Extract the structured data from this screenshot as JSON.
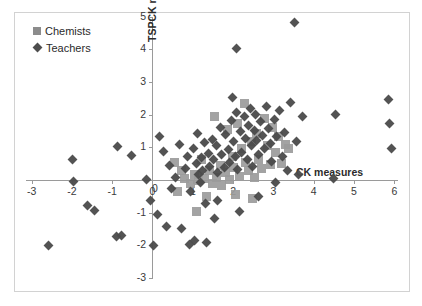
{
  "chart_data": {
    "type": "scatter",
    "title": "",
    "xlabel": "CK measures",
    "ylabel": "TSPCK measures",
    "xlim": [
      -3.2,
      6.2
    ],
    "ylim": [
      -3,
      5
    ],
    "xticks": [
      -3,
      -2,
      -1,
      0,
      1,
      2,
      3,
      4,
      5,
      6
    ],
    "xticklabels": [
      "-3",
      "-2",
      "-1",
      "0",
      "1",
      "2",
      "3",
      "4",
      "5",
      "6"
    ],
    "yticks": [
      -3,
      -2,
      -1,
      0,
      1,
      2,
      3,
      4,
      5
    ],
    "yticklabels": [
      "-3",
      "-2",
      "-1",
      "0",
      "1",
      "2",
      "3",
      "4",
      "5"
    ],
    "grid": false,
    "legend_position": "top-left",
    "legend": [
      "Chemists",
      "Teachers"
    ],
    "colors": {
      "chemists": "#9b9b9b",
      "teachers": "#4a4a4a",
      "axis": "#9a9a9a",
      "frame": "#d2d2d2",
      "text": "#2b2b2b"
    },
    "series": [
      {
        "name": "Chemists",
        "marker": "square",
        "color": "#9b9b9b",
        "points": [
          [
            0.55,
            0.55
          ],
          [
            0.72,
            0.28
          ],
          [
            0.8,
            0.05
          ],
          [
            0.95,
            -0.1
          ],
          [
            1.05,
            0.18
          ],
          [
            1.15,
            -0.02
          ],
          [
            1.22,
            0.62
          ],
          [
            1.28,
            0.05
          ],
          [
            1.35,
            -0.52
          ],
          [
            1.42,
            0.3
          ],
          [
            1.48,
            -0.12
          ],
          [
            1.55,
            1.95
          ],
          [
            1.6,
            0.08
          ],
          [
            1.68,
            0.45
          ],
          [
            1.72,
            -0.18
          ],
          [
            1.8,
            0.22
          ],
          [
            1.85,
            1.55
          ],
          [
            1.92,
            0.02
          ],
          [
            1.98,
            0.72
          ],
          [
            2.02,
            0.38
          ],
          [
            2.1,
            1.72
          ],
          [
            2.15,
            0.12
          ],
          [
            2.22,
            0.95
          ],
          [
            2.28,
            2.35
          ],
          [
            2.32,
            0.55
          ],
          [
            2.38,
            0.28
          ],
          [
            2.45,
            1.18
          ],
          [
            2.52,
            0.08
          ],
          [
            2.58,
            1.42
          ],
          [
            2.62,
            0.62
          ],
          [
            2.7,
            0.35
          ],
          [
            2.78,
            1.88
          ],
          [
            2.85,
            1.05
          ],
          [
            2.92,
            0.48
          ],
          [
            2.98,
            1.62
          ],
          [
            3.05,
            0.85
          ],
          [
            3.12,
            1.32
          ],
          [
            3.2,
            0.52
          ],
          [
            3.3,
            1.08
          ],
          [
            3.38,
            0.95
          ],
          [
            1.1,
            -0.95
          ],
          [
            2.05,
            -0.45
          ],
          [
            2.48,
            -0.58
          ],
          [
            0.62,
            -0.35
          ]
        ]
      },
      {
        "name": "Teachers",
        "marker": "diamond",
        "color": "#4a4a4a",
        "points": [
          [
            -2.58,
            -2.0
          ],
          [
            -1.95,
            -0.05
          ],
          [
            -1.98,
            0.62
          ],
          [
            -1.62,
            -0.78
          ],
          [
            -1.45,
            -0.92
          ],
          [
            -0.9,
            -1.72
          ],
          [
            -0.78,
            -1.7
          ],
          [
            -0.52,
            0.75
          ],
          [
            -0.15,
            0.02
          ],
          [
            -0.05,
            -0.62
          ],
          [
            0.02,
            -2.0
          ],
          [
            0.12,
            -1.05
          ],
          [
            0.28,
            0.88
          ],
          [
            0.42,
            0.45
          ],
          [
            0.48,
            -0.25
          ],
          [
            0.58,
            0.08
          ],
          [
            0.68,
            1.08
          ],
          [
            0.72,
            -1.48
          ],
          [
            0.82,
            0.35
          ],
          [
            0.88,
            0.72
          ],
          [
            0.95,
            -0.35
          ],
          [
            1.02,
            0.95
          ],
          [
            1.08,
            0.52
          ],
          [
            1.12,
            1.42
          ],
          [
            1.15,
            0.18
          ],
          [
            1.18,
            -0.08
          ],
          [
            1.22,
            0.68
          ],
          [
            1.25,
            0.28
          ],
          [
            1.3,
            1.15
          ],
          [
            1.32,
            -0.72
          ],
          [
            1.38,
            0.82
          ],
          [
            1.42,
            0.42
          ],
          [
            1.48,
            1.25
          ],
          [
            1.52,
            0.62
          ],
          [
            1.55,
            -1.18
          ],
          [
            1.58,
            1.05
          ],
          [
            1.62,
            0.22
          ],
          [
            1.68,
            1.62
          ],
          [
            1.72,
            0.78
          ],
          [
            1.78,
            0.38
          ],
          [
            1.82,
            1.38
          ],
          [
            1.88,
            0.92
          ],
          [
            1.92,
            0.55
          ],
          [
            1.95,
            1.82
          ],
          [
            1.98,
            2.52
          ],
          [
            2.02,
            1.18
          ],
          [
            2.05,
            0.72
          ],
          [
            2.08,
            4.02
          ],
          [
            2.12,
            0.32
          ],
          [
            2.18,
            1.48
          ],
          [
            2.22,
            0.85
          ],
          [
            2.28,
            1.95
          ],
          [
            2.32,
            1.28
          ],
          [
            2.35,
            0.62
          ],
          [
            2.38,
            1.68
          ],
          [
            2.42,
            2.18
          ],
          [
            2.45,
            1.05
          ],
          [
            2.48,
            0.42
          ],
          [
            2.52,
            1.52
          ],
          [
            2.55,
            2.02
          ],
          [
            2.58,
            1.22
          ],
          [
            2.62,
            0.78
          ],
          [
            2.68,
            1.78
          ],
          [
            2.72,
            1.35
          ],
          [
            2.78,
            0.95
          ],
          [
            2.82,
            2.25
          ],
          [
            2.88,
            1.58
          ],
          [
            2.92,
            1.12
          ],
          [
            2.95,
            0.58
          ],
          [
            3.02,
            1.85
          ],
          [
            3.08,
            1.32
          ],
          [
            3.15,
            2.12
          ],
          [
            3.22,
            0.72
          ],
          [
            3.28,
            1.45
          ],
          [
            3.35,
            0.28
          ],
          [
            3.42,
            2.38
          ],
          [
            3.52,
            4.82
          ],
          [
            3.58,
            1.18
          ],
          [
            3.62,
            0.18
          ],
          [
            3.72,
            1.95
          ],
          [
            4.48,
            0.05
          ],
          [
            4.55,
            2.02
          ],
          [
            5.85,
            2.48
          ],
          [
            5.88,
            1.72
          ],
          [
            5.92,
            0.98
          ],
          [
            1.05,
            -1.85
          ],
          [
            0.92,
            -1.98
          ],
          [
            1.35,
            -1.92
          ],
          [
            -0.88,
            1.02
          ],
          [
            2.15,
            -0.95
          ],
          [
            1.62,
            -0.62
          ],
          [
            2.62,
            -0.52
          ],
          [
            3.05,
            -0.08
          ],
          [
            0.35,
            -1.42
          ],
          [
            0.18,
            1.32
          ],
          [
            2.08,
            2.08
          ]
        ]
      }
    ]
  }
}
